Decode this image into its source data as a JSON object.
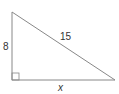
{
  "figure": {
    "type": "right-triangle",
    "stroke_color": "#888888",
    "label_color": "#333333",
    "vertices": {
      "top": [
        12,
        12
      ],
      "right_angle": [
        12,
        80
      ],
      "right": [
        115,
        80
      ]
    },
    "labels": {
      "vertical_leg": "8",
      "hypotenuse": "15",
      "horizontal_leg": "x"
    },
    "right_angle_marker": true
  }
}
